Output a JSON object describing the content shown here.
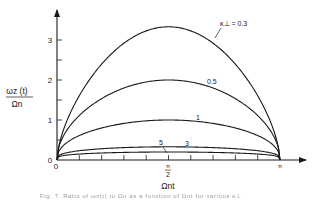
{
  "chart_data": {
    "type": "line",
    "title": "",
    "xlabel": "Ωnt",
    "ylabel": "ωz (t) / Ωn",
    "ylabel_num": "ωz (t)",
    "ylabel_den": "Ωn",
    "xlim": [
      0,
      3.14159
    ],
    "ylim": [
      0,
      3.6
    ],
    "x_ticks": [
      "0",
      "π/2",
      "π"
    ],
    "x_tick_labels": {
      "origin": "0",
      "half_pi_num": "π",
      "half_pi_den": "2",
      "pi": "π"
    },
    "y_ticks": [
      0,
      1,
      2,
      3
    ],
    "y_tick_labels": [
      "0",
      "1",
      "2",
      "3"
    ],
    "grid": false,
    "legend": "inline curve labels",
    "parameter_label": "κ⊥ = 0.3",
    "series": [
      {
        "name": "κ⊥ = 0.3",
        "label": "κ⊥ = 0.3",
        "kappa": 0.3,
        "peak_value": 3.33,
        "peak_x": "π/2"
      },
      {
        "name": "0.5",
        "label": "0.5",
        "kappa": 0.5,
        "peak_value": 2.0,
        "peak_x": "π/2"
      },
      {
        "name": "1",
        "label": "1",
        "kappa": 1,
        "peak_value": 1.0,
        "peak_x": "π/2"
      },
      {
        "name": "3",
        "label": "3",
        "kappa": 3,
        "peak_value": 0.33,
        "peak_x": "π/2"
      },
      {
        "name": "5",
        "label": "5",
        "kappa": 5,
        "peak_value": 0.2,
        "peak_x": "π/2"
      }
    ]
  },
  "caption": "Fig. 7. Ratio of ωz(t) to Ωn as a function of Ωnt for various κ⊥"
}
